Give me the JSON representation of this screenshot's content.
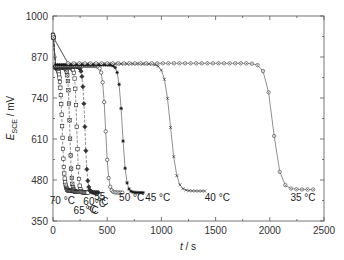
{
  "chart_data": {
    "type": "line",
    "title": "",
    "xlabel": {
      "italic": "t",
      "rest": " / s"
    },
    "ylabel": {
      "italic": "E",
      "sub": "SCE",
      "rest": " / mV"
    },
    "xlim": [
      0,
      2500
    ],
    "ylim": [
      350,
      1000
    ],
    "xticks": [
      0,
      500,
      1000,
      1500,
      2000,
      2500
    ],
    "yticks": [
      350,
      480,
      610,
      740,
      870,
      1000
    ],
    "grid": false,
    "legend": "none (inline curve labels)",
    "series": [
      {
        "name": "70 °C",
        "marker": "square",
        "E_start": 940,
        "E_plateau": 838,
        "t_plateau": 60,
        "t_drop": 85,
        "t_end": 200,
        "E_end": 445
      },
      {
        "name": "65 °C",
        "marker": "square-x",
        "E_start": 940,
        "E_plateau": 838,
        "t_plateau": 60,
        "t_drop": 155,
        "t_end": 250,
        "E_end": 442
      },
      {
        "name": "60 °C",
        "marker": "square",
        "E_start": 940,
        "E_plateau": 838,
        "t_plateau": 60,
        "t_drop": 220,
        "t_end": 320,
        "E_end": 440
      },
      {
        "name": "55 °C",
        "marker": "diamond",
        "E_start": 940,
        "E_plateau": 840,
        "t_plateau": 60,
        "t_drop": 295,
        "t_end": 420,
        "E_end": 440
      },
      {
        "name": "50 °C",
        "marker": "circle",
        "E_start": 940,
        "E_plateau": 842,
        "t_plateau": 60,
        "t_drop": 485,
        "t_end": 640,
        "E_end": 440
      },
      {
        "name": "45 °C",
        "marker": "asterisk",
        "E_start": 940,
        "E_plateau": 845,
        "t_plateau": 60,
        "t_drop": 640,
        "t_end": 830,
        "E_end": 440
      },
      {
        "name": "40 °C",
        "marker": "x",
        "E_start": 940,
        "E_plateau": 848,
        "t_plateau": 350,
        "t_drop": 1085,
        "t_end": 1400,
        "E_end": 445
      },
      {
        "name": "35 °C",
        "marker": "circle-dot",
        "E_start": 940,
        "E_plateau": 850,
        "t_plateau": 350,
        "t_drop": 2030,
        "t_end": 2400,
        "E_end": 450
      }
    ],
    "annotations": [
      {
        "text": "70 °C",
        "t": -30,
        "E": 405
      },
      {
        "text": "65 °C",
        "t": 190,
        "E": 372
      },
      {
        "text": "60 °C",
        "t": 280,
        "E": 402
      },
      {
        "text": "°C",
        "t": 300,
        "E": 375
      },
      {
        "text": "55",
        "t": 380,
        "E": 418
      },
      {
        "text": "°C",
        "t": 385,
        "E": 395
      },
      {
        "text": "50 °C",
        "t": 610,
        "E": 415
      },
      {
        "text": "45 °C",
        "t": 850,
        "E": 415
      },
      {
        "text": "40 °C",
        "t": 1400,
        "E": 415
      },
      {
        "text": "35 °C",
        "t": 2190,
        "E": 415
      }
    ]
  }
}
